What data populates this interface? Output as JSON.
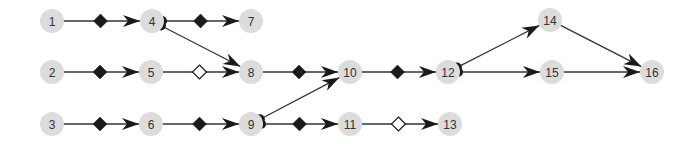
{
  "diagram": {
    "type": "directed-graph",
    "colors": {
      "node_fill": "#dcdcdc",
      "edge": "#333333",
      "marker_filled": "#1a1a1a",
      "marker_open": "#ffffff"
    },
    "nodes": [
      {
        "id": "1",
        "label": "1",
        "x": 52,
        "y": 21
      },
      {
        "id": "4",
        "label": "4",
        "x": 152,
        "y": 21
      },
      {
        "id": "7",
        "label": "7",
        "x": 251,
        "y": 21
      },
      {
        "id": "14",
        "label": "14",
        "x": 550,
        "y": 20
      },
      {
        "id": "2",
        "label": "2",
        "x": 52,
        "y": 72
      },
      {
        "id": "5",
        "label": "5",
        "x": 151,
        "y": 72
      },
      {
        "id": "8",
        "label": "8",
        "x": 251,
        "y": 72
      },
      {
        "id": "10",
        "label": "10",
        "x": 350,
        "y": 72
      },
      {
        "id": "12",
        "label": "12",
        "x": 448,
        "y": 72
      },
      {
        "id": "15",
        "label": "15",
        "x": 552,
        "y": 72
      },
      {
        "id": "16",
        "label": "16",
        "x": 652,
        "y": 72
      },
      {
        "id": "3",
        "label": "3",
        "x": 52,
        "y": 124
      },
      {
        "id": "6",
        "label": "6",
        "x": 151,
        "y": 124
      },
      {
        "id": "9",
        "label": "9",
        "x": 251,
        "y": 124
      },
      {
        "id": "11",
        "label": "11",
        "x": 350,
        "y": 124
      },
      {
        "id": "13",
        "label": "13",
        "x": 450,
        "y": 124
      }
    ],
    "edges": [
      {
        "from": "1",
        "to": "4",
        "mid_marker": "filled-diamond",
        "start_dot": false
      },
      {
        "from": "4",
        "to": "7",
        "mid_marker": "filled-diamond",
        "start_dot": true
      },
      {
        "from": "4",
        "to": "8",
        "mid_marker": "none",
        "start_dot": true
      },
      {
        "from": "2",
        "to": "5",
        "mid_marker": "filled-diamond",
        "start_dot": false
      },
      {
        "from": "5",
        "to": "8",
        "mid_marker": "open-diamond",
        "start_dot": false
      },
      {
        "from": "8",
        "to": "10",
        "mid_marker": "filled-diamond",
        "start_dot": false
      },
      {
        "from": "10",
        "to": "12",
        "mid_marker": "filled-diamond",
        "start_dot": false
      },
      {
        "from": "12",
        "to": "14",
        "mid_marker": "none",
        "start_dot": true
      },
      {
        "from": "12",
        "to": "15",
        "mid_marker": "none",
        "start_dot": true
      },
      {
        "from": "14",
        "to": "16",
        "mid_marker": "none",
        "start_dot": false
      },
      {
        "from": "15",
        "to": "16",
        "mid_marker": "none",
        "start_dot": false
      },
      {
        "from": "3",
        "to": "6",
        "mid_marker": "filled-diamond",
        "start_dot": false
      },
      {
        "from": "6",
        "to": "9",
        "mid_marker": "filled-diamond",
        "start_dot": false
      },
      {
        "from": "9",
        "to": "10",
        "mid_marker": "none",
        "start_dot": true
      },
      {
        "from": "9",
        "to": "11",
        "mid_marker": "filled-diamond",
        "start_dot": true
      },
      {
        "from": "11",
        "to": "13",
        "mid_marker": "open-diamond",
        "start_dot": false
      }
    ]
  }
}
